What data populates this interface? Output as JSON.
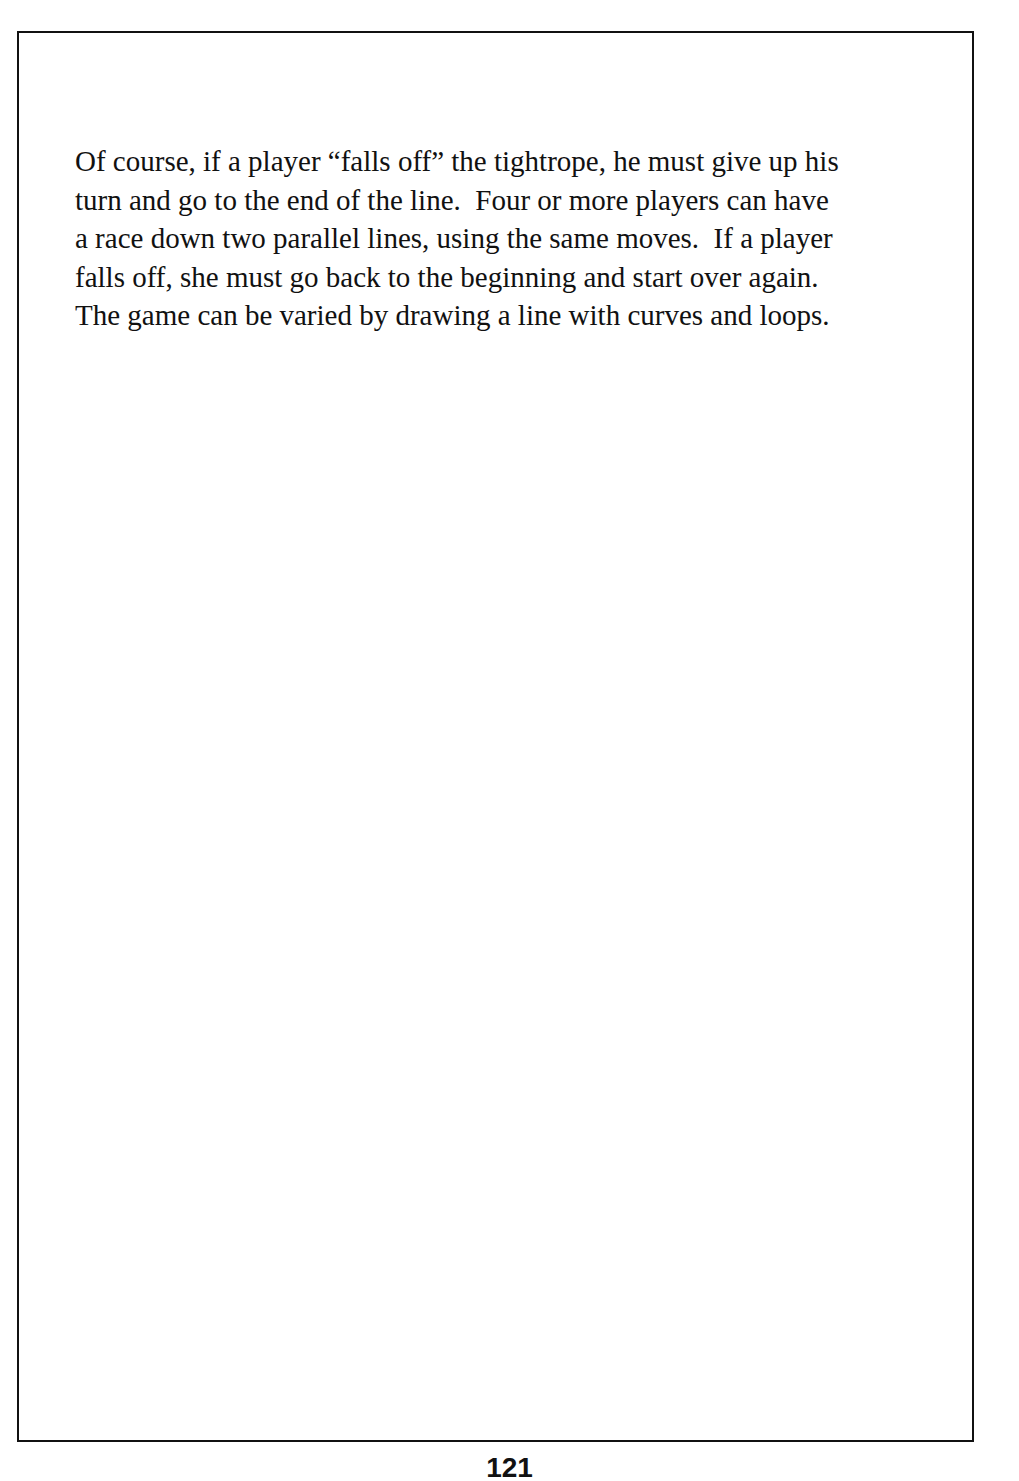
{
  "page": {
    "paragraph_lines": [
      "Of course, if a player “falls off” the tightrope, he must give up his",
      "turn and go to the end of the line.  Four or more players can have",
      "a race down two parallel lines, using the same moves.  If a player",
      "falls off, she must go back to the beginning and start over again.",
      "The game can be varied by drawing a line with curves and loops."
    ],
    "page_number": "121"
  },
  "colors": {
    "text": "#111111",
    "border": "#111111",
    "background": "#ffffff"
  }
}
